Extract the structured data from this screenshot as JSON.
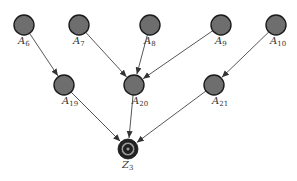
{
  "diagram": {
    "node_fill": "#6e6e6e",
    "node_stroke": "#1a1a1a",
    "edge_color": "#444444",
    "nodes": [
      {
        "id": "A6",
        "label": "A",
        "sub": "6",
        "x": 24,
        "y": 25,
        "type": "input"
      },
      {
        "id": "A7",
        "label": "A",
        "sub": "7",
        "x": 79,
        "y": 25,
        "type": "input"
      },
      {
        "id": "A8",
        "label": "A",
        "sub": "8",
        "x": 150,
        "y": 25,
        "type": "input"
      },
      {
        "id": "A9",
        "label": "A",
        "sub": "9",
        "x": 221,
        "y": 25,
        "type": "input"
      },
      {
        "id": "A10",
        "label": "A",
        "sub": "10",
        "x": 276,
        "y": 25,
        "type": "input"
      },
      {
        "id": "A19",
        "label": "A",
        "sub": "19",
        "x": 64,
        "y": 85,
        "type": "intermediate"
      },
      {
        "id": "A20",
        "label": "A",
        "sub": "20",
        "x": 134,
        "y": 85,
        "type": "intermediate"
      },
      {
        "id": "A21",
        "label": "A",
        "sub": "21",
        "x": 214,
        "y": 85,
        "type": "intermediate"
      },
      {
        "id": "Z3",
        "label": "Z",
        "sub": "3",
        "x": 128,
        "y": 149,
        "type": "target"
      }
    ],
    "edges": [
      {
        "from": "A6",
        "to": "A19"
      },
      {
        "from": "A7",
        "to": "A20"
      },
      {
        "from": "A8",
        "to": "A20"
      },
      {
        "from": "A9",
        "to": "A20"
      },
      {
        "from": "A10",
        "to": "A21"
      },
      {
        "from": "A19",
        "to": "Z3"
      },
      {
        "from": "A20",
        "to": "Z3"
      },
      {
        "from": "A21",
        "to": "Z3"
      }
    ]
  }
}
